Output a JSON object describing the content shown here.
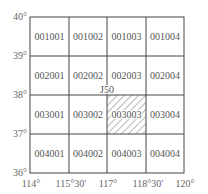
{
  "diagram": {
    "type": "map-sheet-index-grid",
    "sheet_label": "J50",
    "highlighted_cell": "003003",
    "lat_labels": [
      "40°",
      "39°",
      "38°",
      "37°",
      "36°"
    ],
    "lon_labels": [
      "114°",
      "115°30′",
      "117°",
      "118°30′",
      "120°"
    ],
    "rows": [
      [
        "001001",
        "001002",
        "001003",
        "001004"
      ],
      [
        "002001",
        "002002",
        "002003",
        "002004"
      ],
      [
        "003001",
        "003002",
        "003003",
        "003004"
      ],
      [
        "004001",
        "004002",
        "004003",
        "004004"
      ]
    ],
    "colors": {
      "grid_line": "#444444",
      "text": "#555555",
      "hatch": "#666666",
      "background": "#ffffff"
    }
  }
}
